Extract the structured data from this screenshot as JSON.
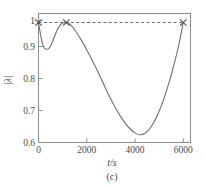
{
  "chart_data": {
    "type": "line",
    "title": "",
    "subtitle": "",
    "xlabel": "t/s",
    "ylabel": "|λ|",
    "caption": "(c)",
    "xlim": [
      0,
      6300
    ],
    "ylim": [
      0.6,
      1.03
    ],
    "grid": false,
    "legend": null,
    "x_ticks": [
      0,
      2000,
      4000,
      6000
    ],
    "x_tick_labels": [
      "0",
      "2000",
      "4000",
      "6000"
    ],
    "y_ticks": [
      0.6,
      0.7,
      0.8,
      0.9,
      1.0
    ],
    "y_tick_labels": [
      "0.6",
      "0.7",
      "0.8",
      "0.9",
      "1"
    ],
    "series": [
      {
        "name": "|λ|",
        "style": "solid",
        "color": "#6e6e6e",
        "x": [
          0,
          100,
          200,
          300,
          400,
          500,
          600,
          700,
          800,
          900,
          1000,
          1100,
          1200,
          1300,
          1400,
          1500,
          1600,
          1800,
          2000,
          2200,
          2400,
          2600,
          2800,
          3000,
          3200,
          3400,
          3600,
          3800,
          4000,
          4200,
          4400,
          4600,
          4800,
          5000,
          5200,
          5400,
          5600,
          5800,
          6000
        ],
        "y": [
          1.0,
          0.953,
          0.921,
          0.912,
          0.912,
          0.922,
          0.94,
          0.961,
          0.979,
          0.991,
          0.998,
          1.0,
          0.999,
          0.994,
          0.986,
          0.976,
          0.964,
          0.938,
          0.909,
          0.878,
          0.846,
          0.812,
          0.777,
          0.744,
          0.713,
          0.687,
          0.664,
          0.645,
          0.632,
          0.626,
          0.63,
          0.645,
          0.67,
          0.704,
          0.747,
          0.797,
          0.855,
          0.92,
          1.0
        ]
      },
      {
        "name": "unit reference",
        "style": "dashed",
        "color": "#5d5d5d",
        "x": [
          0,
          6000
        ],
        "y": [
          1.0,
          1.0
        ]
      }
    ],
    "markers": [
      {
        "label": "crossing-left",
        "x": 0,
        "y": 1.0,
        "symbol": "x"
      },
      {
        "label": "crossing-mid",
        "x": 1150,
        "y": 1.0,
        "symbol": "x"
      },
      {
        "label": "crossing-right",
        "x": 6000,
        "y": 1.0,
        "symbol": "x"
      }
    ],
    "annotations": []
  }
}
